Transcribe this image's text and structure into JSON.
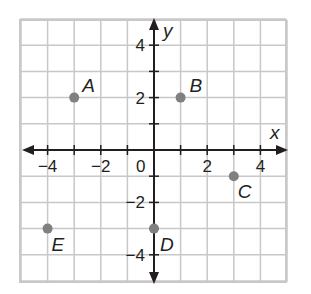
{
  "chart_data": {
    "type": "scatter",
    "title": "",
    "xlabel": "x",
    "ylabel": "y",
    "xlim": [
      -5,
      5
    ],
    "ylim": [
      -5,
      5
    ],
    "grid": true,
    "x_ticks": [
      -4,
      -2,
      0,
      2,
      4
    ],
    "x_tick_labels": [
      "−4",
      "−2",
      "0",
      "2",
      "4"
    ],
    "y_ticks": [
      4,
      2,
      -2,
      -4
    ],
    "y_tick_labels": [
      "4",
      "2",
      "−2",
      "−4"
    ],
    "origin_label": "0",
    "points": [
      {
        "label": "A",
        "x": -3,
        "y": 2
      },
      {
        "label": "B",
        "x": 1,
        "y": 2
      },
      {
        "label": "C",
        "x": 3,
        "y": -1
      },
      {
        "label": "D",
        "x": 0,
        "y": -3
      },
      {
        "label": "E",
        "x": -4,
        "y": -3
      }
    ],
    "colors": {
      "grid": "#c8c8c8",
      "axis": "#231f20",
      "point": "#808080"
    }
  }
}
